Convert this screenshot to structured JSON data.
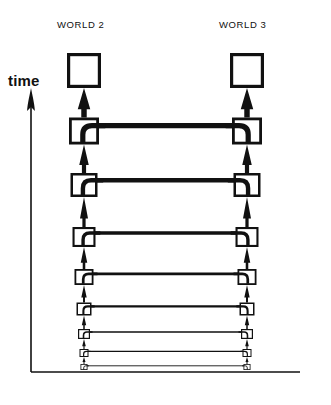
{
  "figure": {
    "title_left": "WORLD 2",
    "title_right": "WORLD 3",
    "axis_label": "time",
    "axis_direction": "up",
    "ink_color": "#111111",
    "background_color": "#ffffff"
  },
  "chart_data": {
    "type": "diagram",
    "title": "",
    "xlabel": "",
    "ylabel": "time",
    "columns": [
      "WORLD 2",
      "WORLD 3"
    ],
    "axis": {
      "vertical": {
        "label": "time",
        "arrow": "up",
        "x": 31,
        "y_top": 92,
        "y_bottom": 372
      },
      "horizontal": {
        "label": "",
        "y": 372,
        "x_left": 31,
        "x_right": 300
      }
    },
    "terminal_boxes": [
      {
        "column": "WORLD 2",
        "x": 67,
        "y": 53,
        "w": 34,
        "h": 35,
        "stroke": 3.2
      },
      {
        "column": "WORLD 3",
        "x": 230,
        "y": 53,
        "w": 34,
        "h": 35,
        "stroke": 3.2
      }
    ],
    "rungs": [
      {
        "index": 1,
        "y": 131,
        "box_w": 30,
        "box_h": 27,
        "stroke": 2.8,
        "bar": 5.2,
        "arrow_w": 11,
        "arrow_len": 30
      },
      {
        "index": 2,
        "y": 185,
        "box_w": 27,
        "box_h": 24,
        "stroke": 2.5,
        "bar": 4.4,
        "arrow_w": 9.5,
        "arrow_len": 27
      },
      {
        "index": 3,
        "y": 237,
        "box_w": 23,
        "box_h": 20,
        "stroke": 2.1,
        "bar": 3.4,
        "arrow_w": 8,
        "arrow_len": 23
      },
      {
        "index": 4,
        "y": 277,
        "box_w": 19,
        "box_h": 16,
        "stroke": 1.8,
        "bar": 2.7,
        "arrow_w": 6.5,
        "arrow_len": 19
      },
      {
        "index": 5,
        "y": 309,
        "box_w": 15,
        "box_h": 13,
        "stroke": 1.5,
        "bar": 2.1,
        "arrow_w": 5.4,
        "arrow_len": 15
      },
      {
        "index": 6,
        "y": 334,
        "box_w": 12,
        "box_h": 10,
        "stroke": 1.2,
        "bar": 1.6,
        "arrow_w": 4.4,
        "arrow_len": 12
      },
      {
        "index": 7,
        "y": 353,
        "box_w": 9,
        "box_h": 8,
        "stroke": 1.0,
        "bar": 1.2,
        "arrow_w": 3.6,
        "arrow_len": 9
      },
      {
        "index": 8,
        "y": 367,
        "box_w": 7,
        "box_h": 6,
        "stroke": 0.8,
        "bar": 0.9,
        "arrow_w": 3.0,
        "arrow_len": 7
      }
    ],
    "rung_count": 8,
    "left_center_x": 84,
    "right_center_x": 247
  }
}
